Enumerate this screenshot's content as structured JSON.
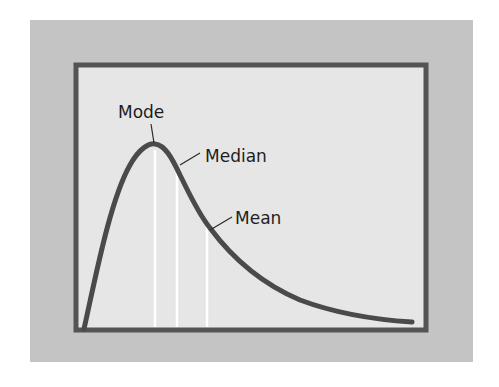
{
  "diagram": {
    "type": "right-skewed-distribution",
    "colors": {
      "outer_background": "#c4c4c4",
      "plot_background": "#e6e6e6",
      "frame": "#545454",
      "curve": "#4a4a4a",
      "marker_lines": "#ffffff",
      "label_text": "#1e1e1e"
    },
    "markers": [
      {
        "id": "mode",
        "label": "Mode",
        "order": 1
      },
      {
        "id": "median",
        "label": "Median",
        "order": 2
      },
      {
        "id": "mean",
        "label": "Mean",
        "order": 3
      }
    ]
  }
}
